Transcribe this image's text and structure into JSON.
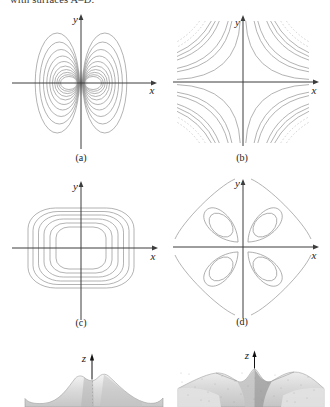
{
  "page": {
    "partial_top_text": "with surfaces A–D."
  },
  "panels": [
    {
      "id": "a",
      "caption": "(a)",
      "x_axis_label": "x",
      "y_axis_label": "y",
      "content": "nested oval level curves in two families mirrored about the y-axis, dense near the origin"
    },
    {
      "id": "b",
      "caption": "(b)",
      "x_axis_label": "x",
      "y_axis_label": "y",
      "content": "hyperbola-like level curves in all four quadrants, denser toward the corners"
    },
    {
      "id": "c",
      "caption": "(c)",
      "x_axis_label": "x",
      "y_axis_label": "y",
      "content": "nested rounded-square level curves centered at the origin"
    },
    {
      "id": "d",
      "caption": "(d)",
      "x_axis_label": "x",
      "y_axis_label": "y",
      "content": "four petal-shaped families of level curves, one per quadrant"
    }
  ],
  "surfaces": [
    {
      "id": "left",
      "z_axis_label": "z",
      "content": "gray surface with steep grooved central peak and flaring skirt"
    },
    {
      "id": "right",
      "z_axis_label": "z",
      "content": "gray surface with central cone peak and four radiating ridges"
    }
  ],
  "colors": {
    "contour_line": "#9a9a9a",
    "axis": "#3c3c3c",
    "surface_gray": "#d8d8d8",
    "background": "#ffffff"
  }
}
